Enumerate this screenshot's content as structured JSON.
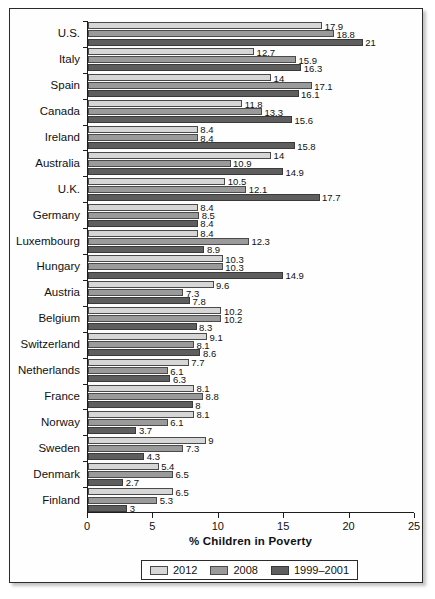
{
  "chart_data": {
    "type": "bar",
    "orientation": "horizontal",
    "title": "",
    "xlabel": "% Children in Poverty",
    "ylabel": "",
    "xlim": [
      0,
      25
    ],
    "xticks": [
      "0",
      "5",
      "10",
      "15",
      "20",
      "25"
    ],
    "grid": false,
    "legend_position": "bottom",
    "categories": [
      "U.S.",
      "Italy",
      "Spain",
      "Canada",
      "Ireland",
      "Australia",
      "U.K.",
      "Germany",
      "Luxembourg",
      "Hungary",
      "Austria",
      "Belgium",
      "Switzerland",
      "Netherlands",
      "France",
      "Norway",
      "Sweden",
      "Denmark",
      "Finland"
    ],
    "series": [
      {
        "name": "2012",
        "color": "#d6d6d6",
        "values": [
          17.9,
          12.7,
          14,
          11.8,
          8.4,
          14,
          10.5,
          8.4,
          8.4,
          10.3,
          9.6,
          10.2,
          9.1,
          7.7,
          8.1,
          8.1,
          9,
          5.4,
          6.5
        ],
        "labels": [
          "17.9",
          "12.7",
          "14",
          "11.8",
          "8.4",
          "14",
          "10.5",
          "8.4",
          "8.4",
          "10.3",
          "9.6",
          "10.2",
          "9.1",
          "7.7",
          "8.1",
          "8.1",
          "9",
          "5.4",
          "6.5"
        ]
      },
      {
        "name": "2008",
        "color": "#9a9a9a",
        "values": [
          18.8,
          15.9,
          17.1,
          13.3,
          8.4,
          10.9,
          12.1,
          8.5,
          12.3,
          10.3,
          7.3,
          10.2,
          8.1,
          6.1,
          8.8,
          6.1,
          7.3,
          6.5,
          5.3
        ],
        "labels": [
          "18.8",
          "15.9",
          "17.1",
          "13.3",
          "8.4",
          "10.9",
          "12.1",
          "8.5",
          "12.3",
          "10.3",
          "7.3",
          "10.2",
          "8.1",
          "6.1",
          "8.8",
          "6.1",
          "7.3",
          "6.5",
          "5.3"
        ]
      },
      {
        "name": "1999–2001",
        "color": "#5e5e5e",
        "values": [
          21,
          16.3,
          16.1,
          15.6,
          15.8,
          14.9,
          17.7,
          8.4,
          8.9,
          14.9,
          7.8,
          8.3,
          8.6,
          6.3,
          8,
          3.7,
          4.3,
          2.7,
          3
        ],
        "labels": [
          "21",
          "16.3",
          "16.1",
          "15.6",
          "15.8",
          "14.9",
          "17.7",
          "8.4",
          "8.9",
          "14.9",
          "7.8",
          "8.3",
          "8.6",
          "6.3",
          "8",
          "3.7",
          "4.3",
          "2.7",
          "3"
        ]
      }
    ]
  }
}
